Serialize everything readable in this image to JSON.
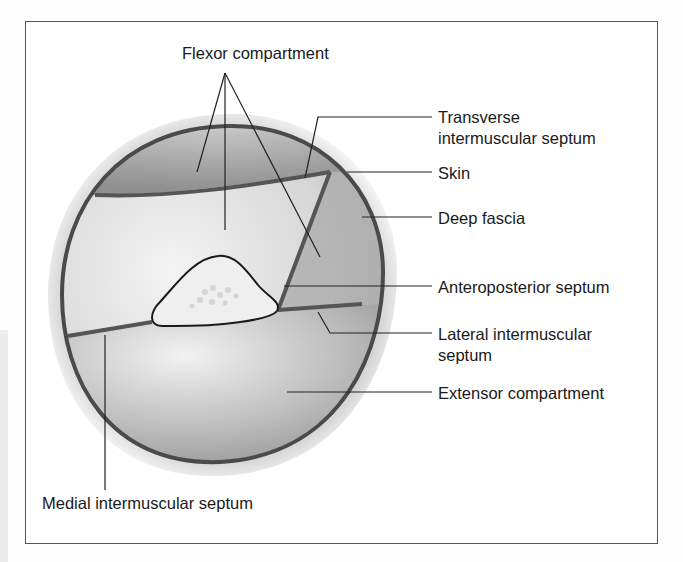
{
  "figure": {
    "labels": {
      "flexor_compartment": "Flexor compartment",
      "transverse_line1": "Transverse",
      "transverse_line2": "intermuscular septum",
      "skin": "Skin",
      "deep_fascia": "Deep fascia",
      "anteroposterior_septum": "Anteroposterior septum",
      "lateral_line1": "Lateral intermuscular",
      "lateral_line2": "septum",
      "extensor_compartment": "Extensor compartment",
      "medial_intermuscular_septum": "Medial intermuscular septum"
    },
    "colors": {
      "frame_border": "#555555",
      "skin_halo": "#d9d9d9",
      "fascia_outline": "#4a4a4a",
      "compartment_fill_dark": "#9a9a9a",
      "compartment_fill_light": "#e6e6e6",
      "bone_fill": "#eeeeee",
      "leader_line": "#222222"
    }
  }
}
